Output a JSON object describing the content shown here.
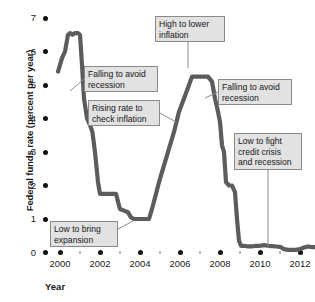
{
  "chart_data": {
    "type": "line",
    "title": "",
    "xlabel": "Year",
    "ylabel": "Federal funds rate (percent per year)",
    "xlim": [
      1999.5,
      2013.2
    ],
    "ylim": [
      0,
      7
    ],
    "grid": false,
    "legend_position": "none",
    "series_name": "Federal funds rate",
    "series_color": "#5c5c5c",
    "y_ticks": [
      {
        "value": 7,
        "label": "7"
      },
      {
        "value": 6,
        "label": "6"
      },
      {
        "value": 5,
        "label": "5"
      },
      {
        "value": 4,
        "label": "4"
      },
      {
        "value": 3,
        "label": "3"
      },
      {
        "value": 2,
        "label": "2"
      },
      {
        "value": 1,
        "label": "1"
      },
      {
        "value": 0,
        "label": "0"
      }
    ],
    "x_ticks": [
      {
        "value": 2000,
        "label": "2000",
        "major": true
      },
      {
        "value": 2001,
        "label": "",
        "major": false
      },
      {
        "value": 2002,
        "label": "2002",
        "major": true
      },
      {
        "value": 2003,
        "label": "",
        "major": false
      },
      {
        "value": 2004,
        "label": "2004",
        "major": true
      },
      {
        "value": 2005,
        "label": "",
        "major": false
      },
      {
        "value": 2006,
        "label": "2006",
        "major": true
      },
      {
        "value": 2007,
        "label": "",
        "major": false
      },
      {
        "value": 2008,
        "label": "2008",
        "major": true
      },
      {
        "value": 2009,
        "label": "",
        "major": false
      },
      {
        "value": 2010,
        "label": "2010",
        "major": true
      },
      {
        "value": 2011,
        "label": "",
        "major": false
      },
      {
        "value": 2012,
        "label": "2012",
        "major": true
      },
      {
        "value": 2013,
        "label": "",
        "major": false
      }
    ],
    "x": [
      1999.9,
      2000.1,
      2000.25,
      2000.4,
      2000.5,
      2000.62,
      2000.75,
      2000.9,
      2001.0,
      2001.1,
      2001.2,
      2001.35,
      2001.5,
      2001.62,
      2001.75,
      2001.9,
      2002.0,
      2002.2,
      2002.4,
      2002.6,
      2002.8,
      2002.95,
      2003.0,
      2003.2,
      2003.4,
      2003.55,
      2003.7,
      2003.9,
      2004.0,
      2004.2,
      2004.45,
      2004.6,
      2004.8,
      2004.95,
      2005.2,
      2005.45,
      2005.7,
      2005.95,
      2006.2,
      2006.45,
      2006.6,
      2006.8,
      2007.0,
      2007.2,
      2007.4,
      2007.6,
      2007.75,
      2007.9,
      2008.0,
      2008.1,
      2008.2,
      2008.3,
      2008.45,
      2008.6,
      2008.75,
      2008.85,
      2008.95,
      2009.05,
      2009.2,
      2009.4,
      2009.6,
      2009.8,
      2010.0,
      2010.2,
      2010.4,
      2010.6,
      2010.8,
      2011.0,
      2011.2,
      2011.4,
      2011.6,
      2011.8,
      2012.0,
      2012.2,
      2012.4,
      2012.6,
      2012.8,
      2013.0
    ],
    "y": [
      5.4,
      5.8,
      6.0,
      6.5,
      6.55,
      6.5,
      6.55,
      6.55,
      6.5,
      5.6,
      4.6,
      4.0,
      3.8,
      3.6,
      3.0,
      2.1,
      1.75,
      1.75,
      1.75,
      1.75,
      1.75,
      1.4,
      1.3,
      1.25,
      1.2,
      1.05,
      1.0,
      1.0,
      1.0,
      1.0,
      1.0,
      1.3,
      1.75,
      2.1,
      2.6,
      3.1,
      3.6,
      4.2,
      4.6,
      5.0,
      5.25,
      5.25,
      5.25,
      5.25,
      5.25,
      5.1,
      4.6,
      4.2,
      3.9,
      3.2,
      3.0,
      2.1,
      2.0,
      2.0,
      1.8,
      1.0,
      0.35,
      0.2,
      0.2,
      0.18,
      0.18,
      0.2,
      0.2,
      0.22,
      0.2,
      0.19,
      0.18,
      0.17,
      0.1,
      0.08,
      0.08,
      0.08,
      0.1,
      0.15,
      0.18,
      0.16,
      0.16,
      0.16
    ],
    "annotations": [
      {
        "id": "falling-to-avoid-recession-2001",
        "text": "Falling to avoid\nrecession",
        "box": {
          "left": 84,
          "top": 66,
          "width": 74,
          "height": 26
        },
        "leader": {
          "x1": 84,
          "y1": 79,
          "x2": 70,
          "y2": 91
        }
      },
      {
        "id": "rising-rate-to-check-inflation",
        "text": "Rising rate to\ncheck inflation",
        "box": {
          "left": 88,
          "top": 100,
          "width": 72,
          "height": 26
        },
        "leader": {
          "x1": 160,
          "y1": 113,
          "x2": 176,
          "y2": 122
        }
      },
      {
        "id": "high-to-lower-inflation",
        "text": "High to lower\ninflation",
        "box": {
          "left": 155,
          "top": 16,
          "width": 70,
          "height": 26
        },
        "leader": {
          "x1": 188,
          "y1": 42,
          "x2": 188,
          "y2": 68
        }
      },
      {
        "id": "falling-to-avoid-recession-2007",
        "text": "Falling to avoid\nrecession",
        "box": {
          "left": 218,
          "top": 79,
          "width": 74,
          "height": 26
        },
        "leader": {
          "x1": 218,
          "y1": 92,
          "x2": 205,
          "y2": 98
        }
      },
      {
        "id": "low-to-fight-credit-crisis",
        "text": "Low to fight\ncredit crisis\nand recession",
        "box": {
          "left": 234,
          "top": 133,
          "width": 68,
          "height": 37
        },
        "leader": {
          "x1": 268,
          "y1": 170,
          "x2": 268,
          "y2": 248
        }
      },
      {
        "id": "low-to-bring-expansion",
        "text": "Low to bring\nexpansion",
        "box": {
          "left": 50,
          "top": 221,
          "width": 68,
          "height": 26
        },
        "leader": {
          "x1": 118,
          "y1": 229,
          "x2": 133,
          "y2": 221
        }
      }
    ]
  }
}
